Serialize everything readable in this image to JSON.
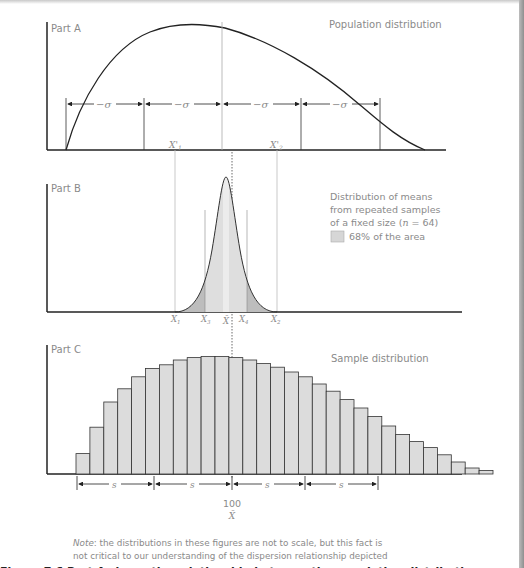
{
  "chart_data": [
    {
      "type": "line",
      "panel": "Part A",
      "title": "Population distribution",
      "description": "Positively skewed population curve rising from origin, peaking near center-left, tailing off to the right",
      "interval_labels": [
        "-σ",
        "-σ",
        "-σ",
        "-σ"
      ],
      "interval_count": 4,
      "markers": [
        "X'1",
        "X'2"
      ],
      "grid": false
    },
    {
      "type": "area",
      "panel": "Part B",
      "title": "Distribution of means from repeated samples of a fixed size (n = 64)",
      "legend": [
        {
          "label": "68% of the area",
          "color": "#d9d9d9"
        }
      ],
      "sample_size_n": 64,
      "x_tick_labels": [
        "X1",
        "X3",
        "X̄",
        "X4",
        "X2"
      ],
      "shaded_percent": 68,
      "grid": false
    },
    {
      "type": "bar",
      "panel": "Part C",
      "title": "Sample distribution",
      "categories": [
        "1",
        "2",
        "3",
        "4",
        "5",
        "6",
        "7",
        "8",
        "9",
        "10",
        "11",
        "12",
        "13",
        "14",
        "15",
        "16",
        "17",
        "18",
        "19",
        "20",
        "21",
        "22",
        "23",
        "24",
        "25",
        "26",
        "27",
        "28",
        "29",
        "30",
        "31",
        "32",
        "33",
        "34",
        "35",
        "36",
        "37"
      ],
      "values": [
        17,
        39,
        60,
        71,
        81,
        88,
        91,
        95,
        97,
        98,
        98,
        97,
        95,
        92,
        89,
        85,
        81,
        75,
        69,
        62,
        55,
        48,
        40,
        33,
        27,
        22,
        16,
        10,
        5,
        3,
        0,
        0,
        0,
        0,
        0,
        0,
        0
      ],
      "interval_labels": [
        "s",
        "s",
        "s",
        "s"
      ],
      "center_value": 100,
      "center_label": "X̄",
      "xlabel": "",
      "ylabel": "",
      "grid": false
    }
  ],
  "panels": {
    "a": {
      "label": "Part A",
      "title": "Population distribution",
      "sigma": "−σ"
    },
    "b": {
      "label": "Part B",
      "legend_line1": "Distribution of means",
      "legend_line2": "from repeated samples",
      "legend_line3_pre": "of a fixed size (",
      "legend_n": "n",
      "legend_line3_post": " = 64)",
      "legend_swatch": "68% of the area",
      "x_prime_1": "X'",
      "x_prime_1_sub": "1",
      "x_prime_2": "X'",
      "x_prime_2_sub": "2",
      "ticks": [
        {
          "t": "X",
          "s": "1"
        },
        {
          "t": "X",
          "s": "3"
        },
        {
          "t": "X̄",
          "s": ""
        },
        {
          "t": "X",
          "s": "4"
        },
        {
          "t": "X",
          "s": "2"
        }
      ]
    },
    "c": {
      "label": "Part C",
      "title": "Sample distribution",
      "s": "s",
      "center_value": "100",
      "center_symbol": "X̄"
    }
  },
  "note": {
    "prefix": "Note",
    "text_line1": ": the distributions in these figures are not to scale, but this fact is",
    "text_line2": "not critical to our understanding of the dispersion relationship depicted"
  },
  "cut_off_text": "Figure 7.6   Part A shows the relationship between the population distribution, sample distribution and distribution of"
}
